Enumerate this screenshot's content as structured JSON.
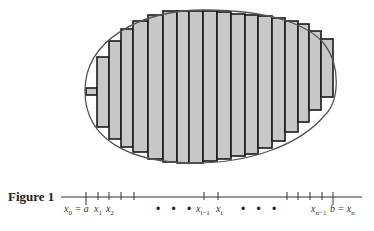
{
  "figure": {
    "caption": "Figure 1",
    "colors": {
      "fill": "#c8c8c8",
      "stroke": "#1a1a1a",
      "curve": "#555555"
    },
    "region": {
      "shape": "egg",
      "cx": 210,
      "cy": 87,
      "description": "closed egg-shaped region with inscribed/circumscribed vertical rectangles"
    },
    "rectangles": [
      {
        "x0": 86,
        "x1": 97,
        "top": 88,
        "bottom": 95
      },
      {
        "x0": 97,
        "x1": 109,
        "top": 57,
        "bottom": 127
      },
      {
        "x0": 109,
        "x1": 121,
        "top": 41,
        "bottom": 139
      },
      {
        "x0": 121,
        "x1": 133,
        "top": 29,
        "bottom": 147
      },
      {
        "x0": 133,
        "x1": 148,
        "top": 21,
        "bottom": 152
      },
      {
        "x0": 148,
        "x1": 163,
        "top": 15,
        "bottom": 159
      },
      {
        "x0": 163,
        "x1": 177,
        "top": 11,
        "bottom": 162
      },
      {
        "x0": 177,
        "x1": 189,
        "top": 11,
        "bottom": 163
      },
      {
        "x0": 189,
        "x1": 203,
        "top": 11,
        "bottom": 163
      },
      {
        "x0": 203,
        "x1": 217,
        "top": 11,
        "bottom": 161
      },
      {
        "x0": 217,
        "x1": 231,
        "top": 12,
        "bottom": 159
      },
      {
        "x0": 231,
        "x1": 245,
        "top": 14,
        "bottom": 156
      },
      {
        "x0": 245,
        "x1": 258,
        "top": 15,
        "bottom": 154
      },
      {
        "x0": 258,
        "x1": 272,
        "top": 16,
        "bottom": 148
      },
      {
        "x0": 272,
        "x1": 285,
        "top": 18,
        "bottom": 141
      },
      {
        "x0": 285,
        "x1": 298,
        "top": 21,
        "bottom": 132
      },
      {
        "x0": 298,
        "x1": 309,
        "top": 24,
        "bottom": 122
      },
      {
        "x0": 309,
        "x1": 321,
        "top": 31,
        "bottom": 110
      },
      {
        "x0": 321,
        "x1": 333,
        "top": 39,
        "bottom": 97
      }
    ],
    "axis": {
      "y": 197,
      "x_start": 61,
      "x_end": 362,
      "ticks": [
        86,
        98,
        109,
        121,
        134,
        204,
        218,
        287,
        298,
        310,
        322,
        333
      ],
      "major_ticks": [
        86,
        333
      ]
    },
    "labels": [
      {
        "id": "x0",
        "var": "x",
        "sub": "0",
        "suffix": " = a",
        "x": 64
      },
      {
        "id": "x1",
        "var": "x",
        "sub": "1",
        "suffix": "",
        "x": 94
      },
      {
        "id": "x2",
        "var": "x",
        "sub": "2",
        "suffix": "",
        "x": 106
      },
      {
        "id": "xim1",
        "var": "x",
        "sub": "i−1",
        "suffix": "",
        "x": 196
      },
      {
        "id": "xi",
        "var": "x",
        "sub": "i",
        "suffix": "",
        "x": 216
      },
      {
        "id": "xnm1",
        "var": "x",
        "sub": "n−1",
        "suffix": "",
        "x": 311
      },
      {
        "id": "bxn",
        "var": "b = x",
        "sub": "n",
        "suffix": "",
        "x": 330
      }
    ],
    "ellipses": [
      {
        "text": "• • •",
        "x": 156
      },
      {
        "text": "• • •",
        "x": 241
      }
    ]
  }
}
